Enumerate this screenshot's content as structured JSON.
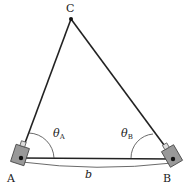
{
  "diagram": {
    "points": {
      "A": {
        "label": "A",
        "x": 20,
        "y": 158
      },
      "B": {
        "label": "B",
        "x": 173,
        "y": 159
      },
      "C": {
        "label": "C",
        "x": 71,
        "y": 19
      }
    },
    "angle_A": {
      "symbol": "θ",
      "subscript": "A"
    },
    "angle_B": {
      "symbol": "θ",
      "subscript": "B"
    },
    "baseline": {
      "label": "b"
    },
    "colors": {
      "line": "#222222",
      "device": "#999999",
      "device_stroke": "#444444"
    }
  }
}
